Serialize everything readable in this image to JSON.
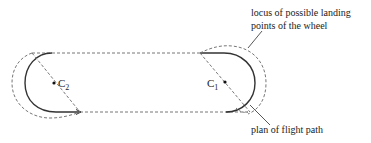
{
  "diagram": {
    "labels": {
      "c1": "C",
      "c1_sub": "1",
      "c2": "C",
      "c2_sub": "2",
      "locus_line1": "locus of possible landing",
      "locus_line2": "points of the wheel",
      "flight_path": "plan of flight path"
    },
    "colors": {
      "solid_path": "#333333",
      "dashed": "#777777",
      "text": "#222222"
    }
  }
}
